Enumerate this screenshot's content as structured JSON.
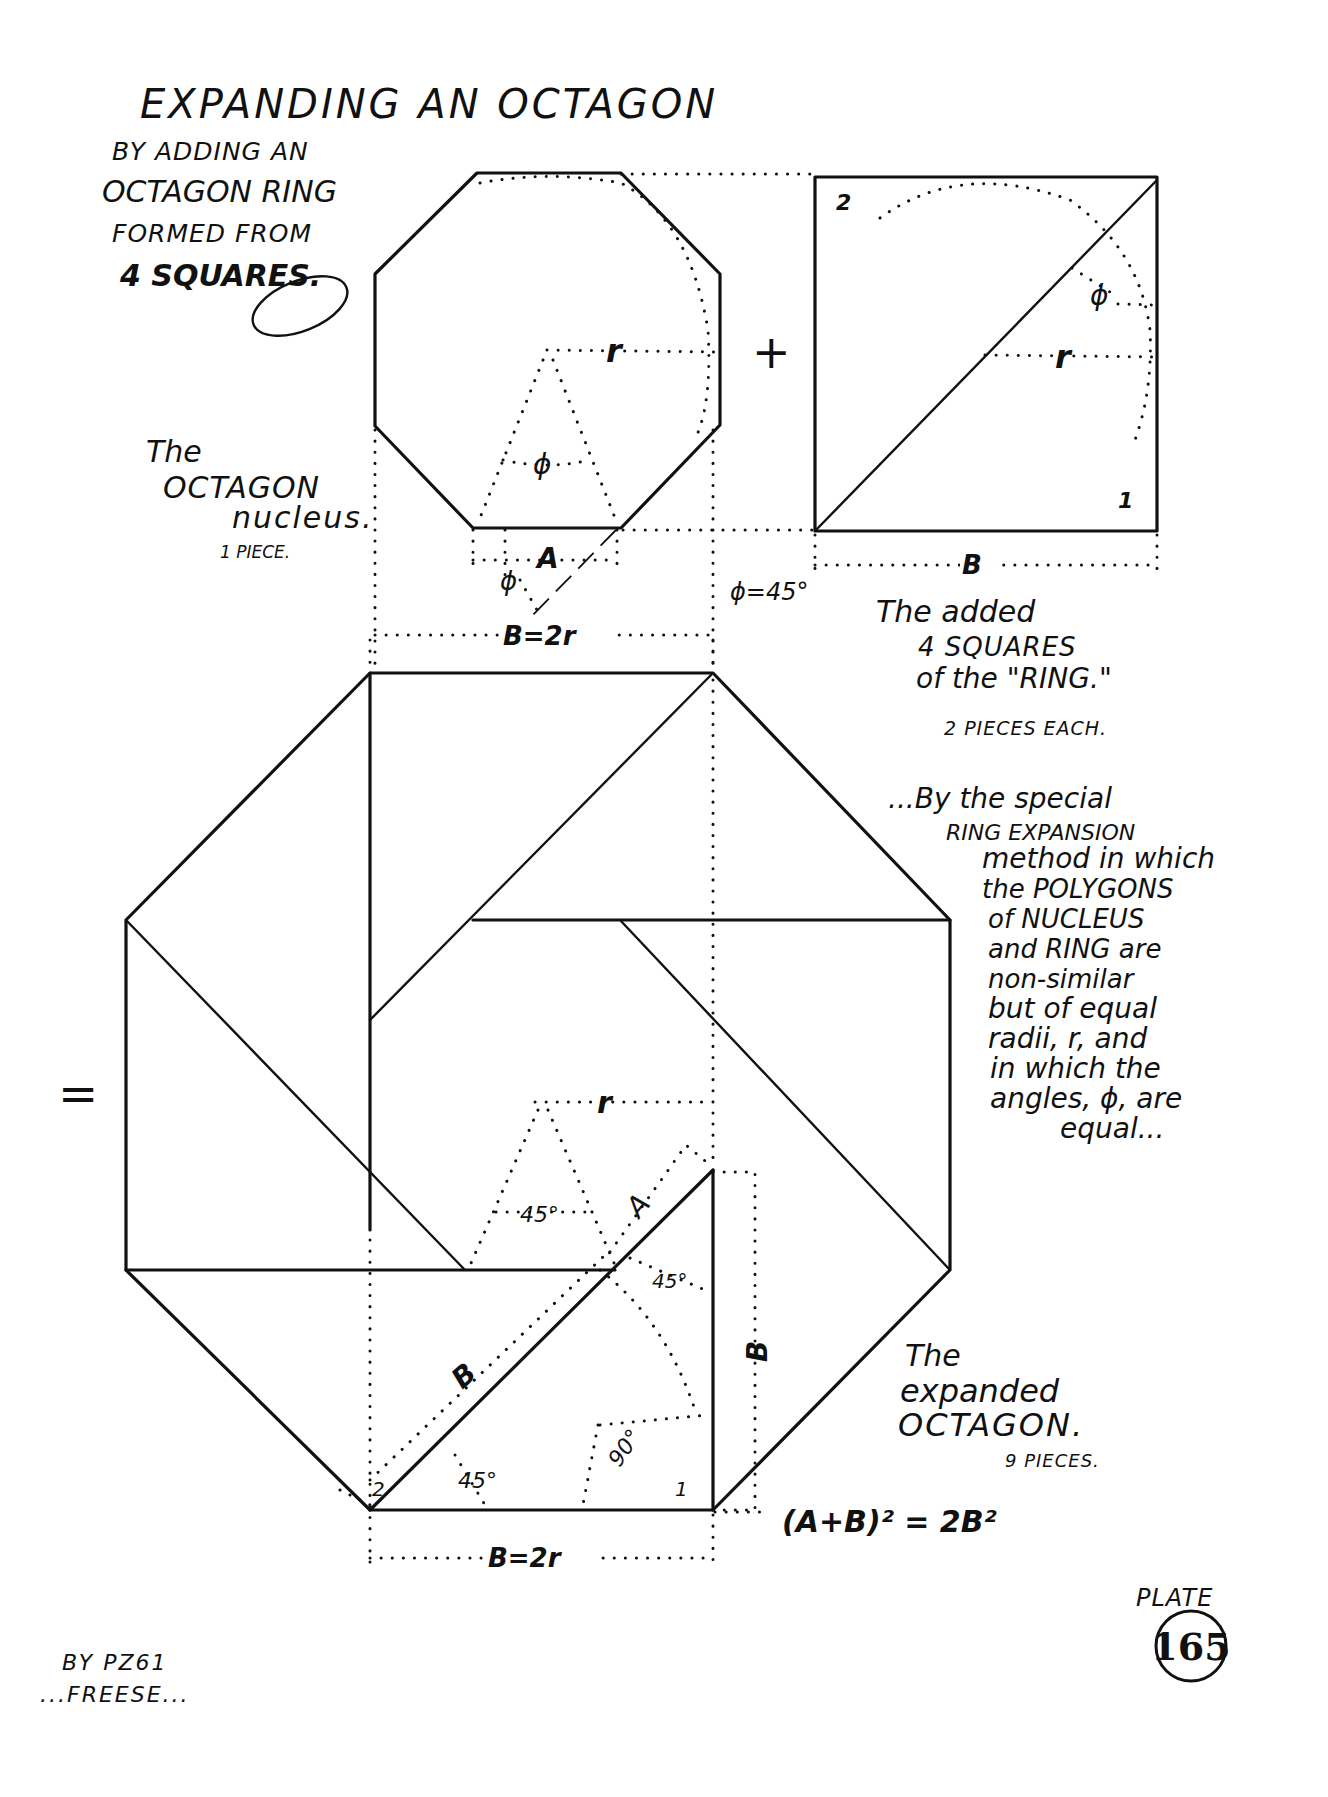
{
  "title": {
    "main": "EXPANDING AN OCTAGON",
    "sub_lines": [
      "BY ADDING AN",
      "OCTAGON RING",
      "FORMED FROM",
      "4 SQUARES."
    ]
  },
  "nucleus": {
    "caption_lines": [
      "The",
      "OCTAGON",
      "nucleus."
    ],
    "pieces": "1 PIECE.",
    "label_r": "r",
    "label_phi": "ϕ",
    "label_A": "A",
    "label_phi_small": "ϕ",
    "dimension": "B=2r"
  },
  "operators": {
    "plus": "+",
    "equals": "="
  },
  "square": {
    "piece_labels": [
      "2",
      "1"
    ],
    "label_r": "r",
    "label_phi": "ϕ",
    "dimension": "B",
    "angle_note": "ϕ=45°",
    "caption_lines": [
      "The added",
      "4 SQUARES",
      "of the \"RING.\""
    ],
    "pieces": "2 PIECES EACH."
  },
  "description": {
    "lines": [
      "...By the special",
      "RING EXPANSION",
      "method in which",
      "the POLYGONS",
      "of NUCLEUS",
      "and RING are",
      "non-similar",
      "but of equal",
      "radii, r, and",
      "in which the",
      "angles, ϕ, are",
      "equal..."
    ]
  },
  "expanded": {
    "labels": {
      "r": "r",
      "angle_45_a": "45°",
      "A": "A",
      "angle_45_b": "45°",
      "B_diag": "B",
      "B_vert": "B",
      "angle_45_c": "45°",
      "angle_90": "90°",
      "piece_2": "2",
      "piece_1": "1"
    },
    "dimension": "B=2r",
    "caption_lines": [
      "The",
      "expanded",
      "OCTAGON."
    ],
    "pieces": "9 PIECES.",
    "formula": "(A+B)² = 2B²"
  },
  "plate": {
    "label": "PLATE",
    "number": "165"
  },
  "signature": {
    "lines": [
      "BY PZ61",
      "...FREESE..."
    ]
  }
}
